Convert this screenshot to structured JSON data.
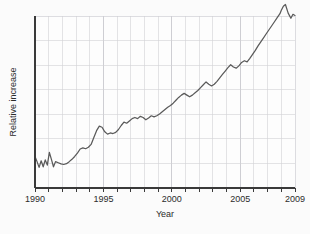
{
  "chart_data": {
    "type": "line",
    "title": "",
    "xlabel": "Year",
    "ylabel": "Relative increase",
    "xlim": [
      1990,
      2009
    ],
    "ylim": [
      0,
      6
    ],
    "grid": true,
    "legend": null,
    "xticks": [
      1990,
      1995,
      2000,
      2005,
      2009
    ],
    "xtick_labels": [
      "1990",
      "1995",
      "2000",
      "2005",
      "2009"
    ],
    "yticks": [],
    "ytick_labels": [],
    "x_minor_ticks_every": 1,
    "y_gridlines_count": 6,
    "line_color": "#5a5a5a",
    "axis_color": "#3a3a3a",
    "grid_color": "#d2d2d6",
    "background_color": "#fbfbfb",
    "plot_background_color": "#fdfdfd",
    "series": [
      {
        "name": "Relative increase",
        "x": [
          1990.0,
          1990.15,
          1990.3,
          1990.45,
          1990.6,
          1990.75,
          1990.9,
          1991.05,
          1991.2,
          1991.35,
          1991.5,
          1991.7,
          1991.9,
          1992.1,
          1992.3,
          1992.5,
          1992.7,
          1992.9,
          1993.1,
          1993.3,
          1993.5,
          1993.7,
          1993.9,
          1994.1,
          1994.3,
          1994.5,
          1994.7,
          1994.9,
          1995.1,
          1995.3,
          1995.5,
          1995.7,
          1995.9,
          1996.1,
          1996.3,
          1996.5,
          1996.7,
          1996.9,
          1997.1,
          1997.3,
          1997.5,
          1997.7,
          1997.9,
          1998.1,
          1998.3,
          1998.5,
          1998.7,
          1998.9,
          1999.1,
          1999.3,
          1999.5,
          1999.7,
          1999.9,
          2000.1,
          2000.3,
          2000.5,
          2000.7,
          2000.9,
          2001.1,
          2001.3,
          2001.5,
          2001.7,
          2001.9,
          2002.1,
          2002.3,
          2002.5,
          2002.7,
          2002.9,
          2003.1,
          2003.3,
          2003.5,
          2003.7,
          2003.9,
          2004.1,
          2004.3,
          2004.5,
          2004.7,
          2004.9,
          2005.1,
          2005.3,
          2005.5,
          2005.7,
          2005.9,
          2006.1,
          2006.3,
          2006.5,
          2006.7,
          2006.9,
          2007.1,
          2007.3,
          2007.5,
          2007.7,
          2007.9,
          2008.0,
          2008.15,
          2008.3,
          2008.5,
          2008.7,
          2008.85,
          2009.0
        ],
        "y": [
          1.1,
          0.92,
          0.72,
          0.95,
          0.74,
          0.98,
          0.8,
          1.24,
          1.0,
          0.74,
          0.92,
          0.88,
          0.84,
          0.82,
          0.85,
          0.92,
          1.0,
          1.1,
          1.22,
          1.36,
          1.4,
          1.37,
          1.42,
          1.52,
          1.76,
          2.0,
          2.16,
          2.12,
          1.96,
          1.88,
          1.92,
          1.9,
          1.94,
          2.04,
          2.18,
          2.3,
          2.26,
          2.34,
          2.42,
          2.46,
          2.42,
          2.5,
          2.46,
          2.38,
          2.44,
          2.52,
          2.48,
          2.52,
          2.58,
          2.66,
          2.74,
          2.82,
          2.88,
          2.96,
          3.06,
          3.16,
          3.24,
          3.3,
          3.24,
          3.18,
          3.24,
          3.32,
          3.4,
          3.5,
          3.6,
          3.7,
          3.62,
          3.56,
          3.62,
          3.72,
          3.84,
          3.96,
          4.08,
          4.2,
          4.3,
          4.22,
          4.18,
          4.26,
          4.38,
          4.44,
          4.4,
          4.52,
          4.66,
          4.8,
          4.96,
          5.1,
          5.24,
          5.38,
          5.52,
          5.66,
          5.8,
          5.94,
          6.08,
          6.2,
          6.34,
          6.4,
          6.1,
          5.92,
          6.06,
          6.02
        ]
      }
    ]
  },
  "labels": {
    "x_axis_title": "Year",
    "y_axis_title": "Relative increase"
  }
}
